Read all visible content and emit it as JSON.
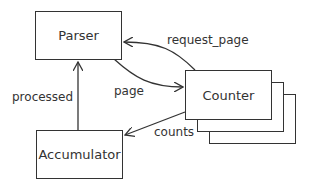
{
  "nodes": {
    "parser": "Parser",
    "counter": "Counter",
    "accumulator": "Accumulator"
  },
  "edges": {
    "request_page": "request_page",
    "page": "page",
    "processed": "processed",
    "counts": "counts"
  }
}
